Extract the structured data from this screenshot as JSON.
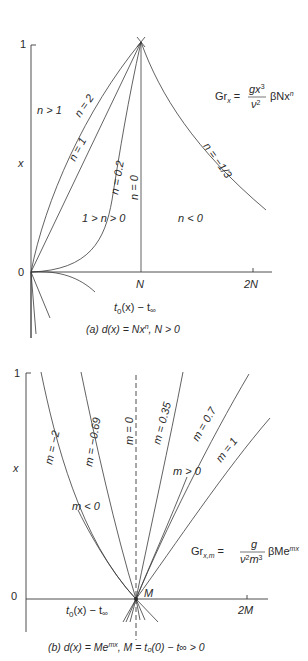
{
  "figure_a": {
    "y_axis_label": "x",
    "y_tick_top": "1",
    "y_tick_origin": "0",
    "x_axis_label_main": "t",
    "x_axis_label_sub0": "0",
    "x_axis_label_mid": "(x) − t",
    "x_axis_label_sub_inf": "∞",
    "x_ticks": [
      "N",
      "2N"
    ],
    "formula": {
      "lhs": "Gr",
      "lhs_sub": "x",
      "eq": "=",
      "num": "gx",
      "num_sup": "3",
      "den": "ν",
      "den_sup": "2",
      "rhs": "βNx",
      "rhs_sup": "n"
    },
    "curve_labels": [
      "n = 2",
      "n = 1",
      "n = 0.2",
      "n = 0",
      "n = −1/3"
    ],
    "region_labels": [
      "n > 1",
      "1 > n > 0",
      "n < 0"
    ],
    "caption_prefix": "(a) ",
    "caption": "d(x) = Nx",
    "caption_sup": "n",
    "caption_suffix": ", N > 0"
  },
  "figure_b": {
    "y_axis_label": "x",
    "y_tick_top": "1",
    "y_tick_origin": "0",
    "x_axis_label_main": "t",
    "x_axis_label_sub0": "0",
    "x_axis_label_mid": "(x) − t",
    "x_axis_label_sub_inf": "∞",
    "x_ticks": [
      "M",
      "2M"
    ],
    "formula": {
      "lhs": "Gr",
      "lhs_sub": "x,m",
      "eq": "=",
      "num": "g",
      "den": "ν",
      "den_sup": "2",
      "den2": "m",
      "den2_sup": "3",
      "rhs": "βMe",
      "rhs_sup": "mx"
    },
    "curve_labels": [
      "m = −2",
      "m = −0.69",
      "m = 0",
      "m = 0.35",
      "m = 0.7",
      "m = 1"
    ],
    "region_labels": [
      "m < 0",
      "m > 0"
    ],
    "caption_prefix": "(b) ",
    "caption": "d(x) = Me",
    "caption_sup": "mx",
    "caption_suffix": ", M = t₀(0) − t∞ > 0"
  }
}
